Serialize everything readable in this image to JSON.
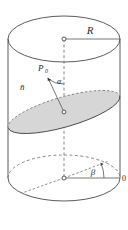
{
  "figure": {
    "background_color": "#ffffff",
    "line_color": "#4a4a4a",
    "dashed_line_color": "#6a6a6a",
    "plane_fill_color": "#d6d6d6",
    "plane_edge_color": "#5a5a5a",
    "text_color": "#2b2b2b"
  },
  "labels": {
    "radius": "R",
    "point": "P",
    "point_subscript": "0",
    "normal": "n̄",
    "angle_alpha": "α",
    "angle_beta": "β",
    "origin": "0"
  },
  "geometry": {
    "cylinder": {
      "center_x": 64,
      "top_center_y": 39,
      "bottom_center_y": 178,
      "radius_x": 56,
      "radius_y": 23
    },
    "top_ellipse": {
      "cx": 64,
      "cy": 39,
      "rx": 56,
      "ry": 23
    },
    "bottom_ellipse": {
      "cx": 64,
      "cy": 178,
      "rx": 56,
      "ry": 23
    },
    "cut_plane_ellipse": {
      "cx": 64,
      "cy": 112,
      "rx": 58,
      "ry": 15,
      "rotation_deg": -16
    },
    "axis": {
      "x": 64,
      "y_top": 39,
      "y_bottom": 178
    },
    "radius_segment_top": {
      "from_x": 64,
      "from_y": 39,
      "to_x": 120,
      "to_y": 39
    },
    "radius_segment_bottom": {
      "from_x": 64,
      "from_y": 178,
      "to_x": 120,
      "to_y": 178
    },
    "normal_vector": {
      "from_x": 63,
      "from_y": 110,
      "to_x": 47,
      "to_y": 77
    }
  },
  "elements": [
    {
      "name": "cylinder-top-ellipse",
      "kind": "ellipse"
    },
    {
      "name": "cylinder-bottom-ellipse",
      "kind": "ellipse"
    },
    {
      "name": "cylinder-left-wall",
      "kind": "line"
    },
    {
      "name": "cylinder-right-wall",
      "kind": "line"
    },
    {
      "name": "cylinder-axis",
      "kind": "dashed-line"
    },
    {
      "name": "cut-plane",
      "kind": "filled-ellipse"
    },
    {
      "name": "normal-vector-arrow",
      "kind": "arrow"
    },
    {
      "name": "angle-alpha-arc",
      "kind": "arc"
    },
    {
      "name": "angle-beta-arc",
      "kind": "arc"
    },
    {
      "name": "radius-line-top",
      "kind": "line"
    },
    {
      "name": "radius-line-bottom",
      "kind": "line"
    },
    {
      "name": "bottom-dashed-chord",
      "kind": "dashed-line"
    },
    {
      "name": "top-center-marker",
      "kind": "point"
    },
    {
      "name": "bottom-center-marker",
      "kind": "point"
    },
    {
      "name": "plane-center-marker",
      "kind": "point"
    }
  ]
}
